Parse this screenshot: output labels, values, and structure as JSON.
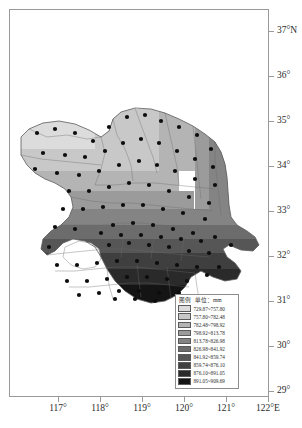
{
  "figure": {
    "type": "choropleth-map",
    "region": "Jiangsu Province, China",
    "variable": "precipitation",
    "unit": "mm"
  },
  "axes": {
    "x": {
      "label_suffix": "E",
      "ticks": [
        {
          "value": 117,
          "label": "117°",
          "px": 58
        },
        {
          "value": 118,
          "label": "118°",
          "px": 100
        },
        {
          "value": 119,
          "label": "119°",
          "px": 142
        },
        {
          "value": 120,
          "label": "120°",
          "px": 184
        },
        {
          "value": 121,
          "label": "121°",
          "px": 226
        },
        {
          "value": 122,
          "label": "122°E",
          "px": 268
        }
      ]
    },
    "y": {
      "label_suffix": "N",
      "ticks": [
        {
          "value": 37,
          "label": "37°N",
          "px": 31
        },
        {
          "value": 36,
          "label": "36°",
          "px": 76
        },
        {
          "value": 35,
          "label": "35°",
          "px": 121
        },
        {
          "value": 34,
          "label": "34°",
          "px": 166
        },
        {
          "value": 33,
          "label": "33°",
          "px": 211
        },
        {
          "value": 32,
          "label": "32°",
          "px": 256
        },
        {
          "value": 31,
          "label": "31°",
          "px": 301
        },
        {
          "value": 30,
          "label": "30°",
          "px": 346
        },
        {
          "value": 29,
          "label": "29°",
          "px": 391
        }
      ]
    }
  },
  "legend": {
    "title": "图例",
    "unit_label": "单位：mm",
    "classes": [
      {
        "range": "729.87~757.80",
        "min": 729.87,
        "max": 757.8,
        "color": "#dcdcdc"
      },
      {
        "range": "757.80~782.48",
        "min": 757.8,
        "max": 782.48,
        "color": "#c8c8c8"
      },
      {
        "range": "782.48~798.92",
        "min": 782.48,
        "max": 798.92,
        "color": "#b4b4b4"
      },
      {
        "range": "798.92~813.78",
        "min": 798.92,
        "max": 813.78,
        "color": "#9b9b9b"
      },
      {
        "range": "813.78~826.98",
        "min": 813.78,
        "max": 826.98,
        "color": "#848484"
      },
      {
        "range": "826.98~841.92",
        "min": 826.98,
        "max": 841.92,
        "color": "#6c6c6c"
      },
      {
        "range": "841.92~859.74",
        "min": 841.92,
        "max": 859.74,
        "color": "#565656"
      },
      {
        "range": "859.74~876.10",
        "min": 859.74,
        "max": 876.1,
        "color": "#3f3f3f"
      },
      {
        "range": "876.10~891.05",
        "min": 876.1,
        "max": 891.05,
        "color": "#2a2a2a"
      },
      {
        "range": "891.05~909.69",
        "min": 891.05,
        "max": 909.69,
        "color": "#141414"
      }
    ]
  },
  "map": {
    "water_color": "#ffffff",
    "boundary_color": "#6b6b6b",
    "station_color": "#0d0d0d",
    "station_count": 97
  }
}
